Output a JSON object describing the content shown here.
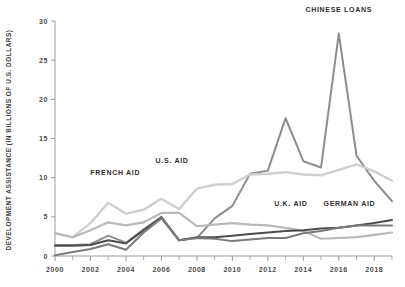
{
  "chart_data": {
    "type": "line",
    "title": "",
    "xlabel": "",
    "ylabel": "DEVELOPMENT ASSISTANCE (IN BILLIONS OF U.S. DOLLARS)",
    "xlim": [
      2000,
      2019
    ],
    "ylim": [
      0,
      30
    ],
    "yticks": [
      0,
      5,
      10,
      15,
      20,
      25,
      30
    ],
    "ytick_labels": [
      "0",
      "5",
      "10",
      "15",
      "20",
      "25",
      "30"
    ],
    "xticks": [
      2000,
      2002,
      2004,
      2006,
      2008,
      2010,
      2012,
      2014,
      2016,
      2018
    ],
    "xtick_labels": [
      "2000",
      "2002",
      "2004",
      "2006",
      "2008",
      "2010",
      "2012",
      "2014",
      "2016",
      "2018"
    ],
    "xticks_minor": [
      2001,
      2003,
      2005,
      2007,
      2009,
      2011,
      2013,
      2015,
      2017,
      2019
    ],
    "grid": false,
    "legend_position": "inline-annotations",
    "x": [
      2000,
      2001,
      2002,
      2003,
      2004,
      2005,
      2006,
      2007,
      2008,
      2009,
      2010,
      2011,
      2012,
      2013,
      2014,
      2015,
      2016,
      2017,
      2018,
      2019
    ],
    "series": [
      {
        "name": "CHINESE LOANS",
        "color": "#8d8d8d",
        "width": 2.0,
        "values": [
          1.4,
          1.4,
          1.5,
          2.6,
          1.7,
          3.4,
          5.0,
          2.0,
          2.3,
          4.8,
          6.4,
          10.5,
          10.9,
          17.6,
          12.1,
          11.3,
          28.4,
          12.8,
          9.6,
          7.0
        ]
      },
      {
        "name": "U.S. AID",
        "color": "#cfcfcf",
        "width": 2.4,
        "values": [
          2.9,
          2.4,
          4.2,
          6.8,
          5.4,
          5.9,
          7.3,
          6.0,
          8.6,
          9.1,
          9.2,
          10.4,
          10.5,
          10.7,
          10.4,
          10.3,
          11.0,
          11.7,
          10.8,
          9.6
        ]
      },
      {
        "name": "FRENCH AID",
        "color": "#b9b9b9",
        "width": 2.2,
        "values": [
          2.9,
          2.4,
          3.3,
          4.3,
          3.9,
          4.3,
          5.5,
          5.5,
          3.8,
          4.0,
          4.2,
          4.0,
          3.9,
          3.6,
          3.2,
          2.2,
          2.3,
          2.4,
          2.7,
          3.0
        ]
      },
      {
        "name": "U.K. AID",
        "color": "#4d4d4d",
        "width": 2.0,
        "values": [
          1.3,
          1.3,
          1.4,
          2.0,
          1.6,
          3.3,
          4.9,
          2.0,
          2.4,
          2.4,
          2.6,
          2.8,
          3.0,
          3.2,
          3.3,
          3.5,
          3.6,
          3.9,
          4.2,
          4.6
        ]
      },
      {
        "name": "GERMAN AID",
        "color": "#7a7a7a",
        "width": 2.0,
        "values": [
          0.1,
          0.5,
          0.9,
          1.5,
          0.8,
          3.0,
          4.8,
          2.0,
          2.3,
          2.2,
          1.9,
          2.1,
          2.3,
          2.3,
          2.9,
          3.2,
          3.6,
          3.9,
          3.9,
          3.9
        ]
      }
    ],
    "annotations": [
      {
        "label": "CHINESE LOANS",
        "x": 2016,
        "y": 31.2,
        "dx": 0,
        "dy": 0
      },
      {
        "label": "U.S. AID",
        "x": 2006.6,
        "y": 11.9,
        "dx": 0,
        "dy": 0
      },
      {
        "label": "FRENCH AID",
        "x": 2003.4,
        "y": 10.3,
        "dx": 0,
        "dy": 0
      },
      {
        "label": "U.K. AID",
        "x": 2013.3,
        "y": 6.4,
        "dx": 0,
        "dy": 0
      },
      {
        "label": "GERMAN AID",
        "x": 2016.6,
        "y": 6.4,
        "dx": 0,
        "dy": 0
      }
    ]
  }
}
